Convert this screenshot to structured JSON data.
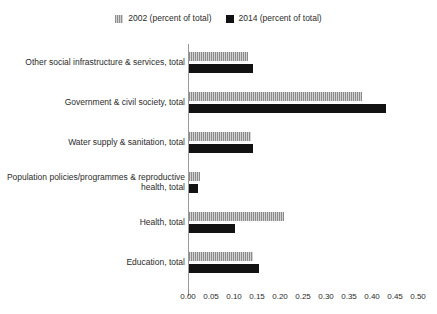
{
  "legend": {
    "position": "top-center",
    "items": [
      {
        "label": "2002 (percent of total)",
        "swatch": "hatched-gray-square",
        "color": "#b6b6b6"
      },
      {
        "label": "2014 (percent of total)",
        "swatch": "solid-black-square",
        "color": "#121212"
      }
    ]
  },
  "axis": {
    "x_ticks": [
      "0.00",
      "0.05",
      "0.10",
      "0.15",
      "0.20",
      "0.25",
      "0.30",
      "0.35",
      "0.40",
      "0.45",
      "0.50"
    ]
  },
  "chart_data": {
    "type": "bar",
    "orientation": "horizontal",
    "title": "",
    "xlabel": "",
    "ylabel": "",
    "xlim": [
      0.0,
      0.5
    ],
    "grid": false,
    "legend_position": "top-center",
    "categories": [
      "Other social infrastructure & services, total",
      "Government & civil society, total",
      "Water supply & sanitation, total",
      "Population policies/programmes & reproductive health, total",
      "Health, total",
      "Education, total"
    ],
    "series": [
      {
        "name": "2002 (percent of total)",
        "color": "#b6b6b6",
        "values": [
          0.128,
          0.376,
          0.135,
          0.024,
          0.207,
          0.139
        ]
      },
      {
        "name": "2014 (percent of total)",
        "color": "#121212",
        "values": [
          0.139,
          0.428,
          0.139,
          0.02,
          0.1,
          0.152
        ]
      }
    ]
  }
}
